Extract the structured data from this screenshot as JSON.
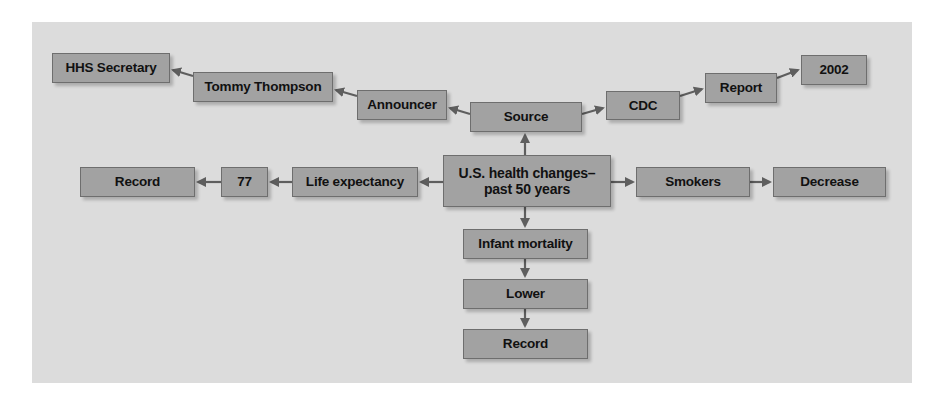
{
  "diagram": {
    "center": {
      "label_line1": "U.S. health changes–",
      "label_line2": "past 50 years"
    },
    "nodes": {
      "source": "Source",
      "announcer": "Announcer",
      "tommy_thompson": "Tommy Thompson",
      "hhs_secretary": "HHS Secretary",
      "cdc": "CDC",
      "report": "Report",
      "year_2002": "2002",
      "life_expectancy": "Life expectancy",
      "seventy_seven": "77",
      "record_left": "Record",
      "smokers": "Smokers",
      "decrease": "Decrease",
      "infant_mortality": "Infant mortality",
      "lower": "Lower",
      "record_bottom": "Record"
    },
    "edges": [
      [
        "center",
        "source"
      ],
      [
        "source",
        "announcer"
      ],
      [
        "announcer",
        "tommy_thompson"
      ],
      [
        "tommy_thompson",
        "hhs_secretary"
      ],
      [
        "source",
        "cdc"
      ],
      [
        "cdc",
        "report"
      ],
      [
        "report",
        "year_2002"
      ],
      [
        "center",
        "life_expectancy"
      ],
      [
        "life_expectancy",
        "seventy_seven"
      ],
      [
        "seventy_seven",
        "record_left"
      ],
      [
        "center",
        "smokers"
      ],
      [
        "smokers",
        "decrease"
      ],
      [
        "center",
        "infant_mortality"
      ],
      [
        "infant_mortality",
        "lower"
      ],
      [
        "lower",
        "record_bottom"
      ]
    ],
    "colors": {
      "panel": "#dcdcdc",
      "node_fill": "#a2a2a2",
      "node_border": "#6e6e6e",
      "arrow": "#5e5e5e"
    }
  }
}
